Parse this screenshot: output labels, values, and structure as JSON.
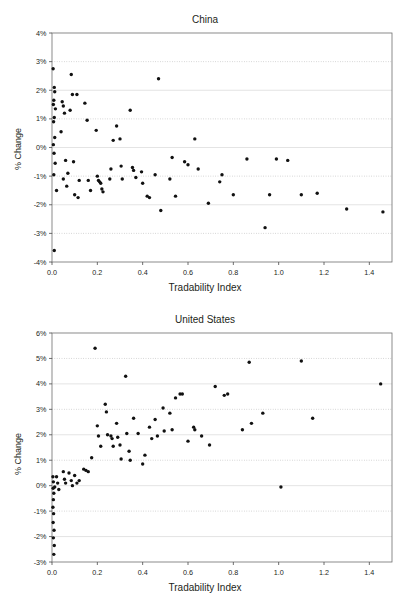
{
  "document": {
    "clipped_top_text": "",
    "background_color": "#ffffff",
    "marker_color": "#111111"
  },
  "figures": [
    {
      "name": "china-scatter",
      "title": "China",
      "xlabel": "Tradability Index",
      "ylabel": "% Change"
    },
    {
      "name": "united-states-scatter",
      "title": "United States",
      "xlabel": "Tradability Index",
      "ylabel": "% Change"
    }
  ],
  "chart_data": [
    {
      "type": "scatter",
      "title": "China",
      "xlabel": "Tradability Index",
      "ylabel": "% Change",
      "xlim": [
        0.0,
        1.5
      ],
      "ylim": [
        -4,
        4
      ],
      "xticks": [
        0.0,
        0.2,
        0.4,
        0.6,
        0.8,
        1.0,
        1.2,
        1.4
      ],
      "xticklabels": [
        "0.0",
        "0.2",
        "0.4",
        "0.6",
        "0.8",
        "1.0",
        "1.2",
        "1.4"
      ],
      "yticks": [
        4,
        3,
        2,
        1,
        0,
        -1,
        -2,
        -3,
        -4
      ],
      "yticklabels": [
        "4%",
        "3%",
        "2%",
        "1%",
        "0%",
        "-1%",
        "-2%",
        "-3%",
        "-4%"
      ],
      "grid": true,
      "legend": null,
      "points": [
        [
          0.005,
          2.75
        ],
        [
          0.01,
          2.1
        ],
        [
          0.012,
          1.95
        ],
        [
          0.008,
          1.65
        ],
        [
          0.006,
          1.5
        ],
        [
          0.015,
          1.35
        ],
        [
          0.01,
          1.05
        ],
        [
          0.007,
          0.9
        ],
        [
          0.012,
          0.35
        ],
        [
          0.006,
          0.1
        ],
        [
          0.009,
          -0.2
        ],
        [
          0.014,
          -0.55
        ],
        [
          0.008,
          -0.95
        ],
        [
          0.02,
          -1.5
        ],
        [
          0.01,
          -3.6
        ],
        [
          0.045,
          1.6
        ],
        [
          0.05,
          1.45
        ],
        [
          0.055,
          1.2
        ],
        [
          0.04,
          0.55
        ],
        [
          0.06,
          -0.45
        ],
        [
          0.07,
          -0.9
        ],
        [
          0.05,
          -1.1
        ],
        [
          0.065,
          -1.35
        ],
        [
          0.085,
          2.55
        ],
        [
          0.09,
          1.85
        ],
        [
          0.11,
          1.85
        ],
        [
          0.08,
          1.3
        ],
        [
          0.095,
          -0.5
        ],
        [
          0.12,
          -1.15
        ],
        [
          0.1,
          -1.65
        ],
        [
          0.115,
          -1.75
        ],
        [
          0.145,
          1.55
        ],
        [
          0.155,
          0.95
        ],
        [
          0.16,
          -1.15
        ],
        [
          0.17,
          -1.5
        ],
        [
          0.195,
          0.6
        ],
        [
          0.2,
          -1.0
        ],
        [
          0.205,
          -1.15
        ],
        [
          0.21,
          -1.2
        ],
        [
          0.215,
          -1.25
        ],
        [
          0.22,
          -1.45
        ],
        [
          0.225,
          -1.55
        ],
        [
          0.255,
          -1.1
        ],
        [
          0.26,
          -0.75
        ],
        [
          0.27,
          0.25
        ],
        [
          0.285,
          0.75
        ],
        [
          0.3,
          0.3
        ],
        [
          0.305,
          -0.65
        ],
        [
          0.31,
          -1.1
        ],
        [
          0.345,
          1.3
        ],
        [
          0.355,
          -0.7
        ],
        [
          0.36,
          -0.8
        ],
        [
          0.37,
          -1.05
        ],
        [
          0.395,
          -0.85
        ],
        [
          0.4,
          -1.25
        ],
        [
          0.42,
          -1.7
        ],
        [
          0.43,
          -1.75
        ],
        [
          0.455,
          -0.95
        ],
        [
          0.47,
          2.4
        ],
        [
          0.48,
          -2.2
        ],
        [
          0.52,
          -1.1
        ],
        [
          0.53,
          -0.35
        ],
        [
          0.545,
          -1.7
        ],
        [
          0.585,
          -0.5
        ],
        [
          0.6,
          -0.6
        ],
        [
          0.63,
          0.3
        ],
        [
          0.645,
          -0.75
        ],
        [
          0.69,
          -1.95
        ],
        [
          0.74,
          -1.2
        ],
        [
          0.75,
          -0.95
        ],
        [
          0.8,
          -1.65
        ],
        [
          0.86,
          -0.4
        ],
        [
          0.94,
          -2.8
        ],
        [
          0.96,
          -1.65
        ],
        [
          0.99,
          -0.4
        ],
        [
          1.04,
          -0.45
        ],
        [
          1.1,
          -1.65
        ],
        [
          1.17,
          -1.6
        ],
        [
          1.3,
          -2.15
        ],
        [
          1.46,
          -2.25
        ]
      ]
    },
    {
      "type": "scatter",
      "title": "United States",
      "xlabel": "Tradability Index",
      "ylabel": "% Change",
      "xlim": [
        0.0,
        1.5
      ],
      "ylim": [
        -3,
        6
      ],
      "xticks": [
        0.0,
        0.2,
        0.4,
        0.6,
        0.8,
        1.0,
        1.2,
        1.4
      ],
      "xticklabels": [
        "0.0",
        "0.2",
        "0.4",
        "0.6",
        "0.8",
        "1.0",
        "1.2",
        "1.4"
      ],
      "yticks": [
        6,
        5,
        4,
        3,
        2,
        1,
        0,
        -1,
        -2,
        -3
      ],
      "yticklabels": [
        "6%",
        "5%",
        "4%",
        "3%",
        "2%",
        "1%",
        "0%",
        "-1%",
        "-2%",
        "-3%"
      ],
      "grid": true,
      "legend": null,
      "points": [
        [
          0.004,
          0.35
        ],
        [
          0.006,
          0.15
        ],
        [
          0.005,
          -0.1
        ],
        [
          0.008,
          -0.3
        ],
        [
          0.006,
          -0.55
        ],
        [
          0.004,
          -0.85
        ],
        [
          0.007,
          -1.1
        ],
        [
          0.005,
          -1.45
        ],
        [
          0.009,
          -1.75
        ],
        [
          0.006,
          -2.05
        ],
        [
          0.01,
          -2.35
        ],
        [
          0.008,
          -2.7
        ],
        [
          0.012,
          -0.05
        ],
        [
          0.02,
          0.35
        ],
        [
          0.025,
          0.1
        ],
        [
          0.03,
          -0.15
        ],
        [
          0.05,
          0.55
        ],
        [
          0.055,
          0.25
        ],
        [
          0.06,
          0.1
        ],
        [
          0.075,
          0.5
        ],
        [
          0.085,
          0.2
        ],
        [
          0.09,
          0.0
        ],
        [
          0.1,
          0.4
        ],
        [
          0.11,
          0.1
        ],
        [
          0.12,
          0.2
        ],
        [
          0.14,
          0.65
        ],
        [
          0.15,
          0.6
        ],
        [
          0.16,
          0.55
        ],
        [
          0.175,
          1.1
        ],
        [
          0.19,
          5.4
        ],
        [
          0.2,
          2.35
        ],
        [
          0.205,
          1.95
        ],
        [
          0.215,
          1.55
        ],
        [
          0.235,
          3.2
        ],
        [
          0.24,
          2.9
        ],
        [
          0.245,
          2.0
        ],
        [
          0.26,
          1.95
        ],
        [
          0.265,
          1.85
        ],
        [
          0.27,
          1.55
        ],
        [
          0.285,
          2.45
        ],
        [
          0.29,
          1.9
        ],
        [
          0.3,
          1.6
        ],
        [
          0.305,
          1.05
        ],
        [
          0.325,
          4.3
        ],
        [
          0.33,
          2.05
        ],
        [
          0.34,
          1.35
        ],
        [
          0.345,
          1.0
        ],
        [
          0.36,
          2.65
        ],
        [
          0.38,
          2.05
        ],
        [
          0.4,
          0.85
        ],
        [
          0.41,
          1.2
        ],
        [
          0.43,
          2.3
        ],
        [
          0.44,
          1.85
        ],
        [
          0.455,
          2.6
        ],
        [
          0.465,
          1.95
        ],
        [
          0.49,
          3.05
        ],
        [
          0.495,
          2.15
        ],
        [
          0.52,
          2.85
        ],
        [
          0.53,
          2.2
        ],
        [
          0.545,
          3.45
        ],
        [
          0.565,
          3.6
        ],
        [
          0.575,
          3.6
        ],
        [
          0.6,
          1.75
        ],
        [
          0.625,
          2.3
        ],
        [
          0.63,
          2.2
        ],
        [
          0.66,
          1.95
        ],
        [
          0.695,
          1.6
        ],
        [
          0.72,
          3.9
        ],
        [
          0.76,
          3.55
        ],
        [
          0.775,
          3.6
        ],
        [
          0.84,
          2.2
        ],
        [
          0.87,
          4.85
        ],
        [
          0.88,
          2.45
        ],
        [
          0.93,
          2.85
        ],
        [
          1.01,
          -0.05
        ],
        [
          1.1,
          4.9
        ],
        [
          1.15,
          2.65
        ],
        [
          1.45,
          4.0
        ]
      ]
    }
  ]
}
